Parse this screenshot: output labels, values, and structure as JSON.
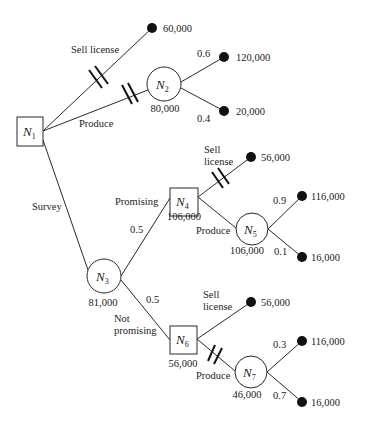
{
  "diagram": {
    "type": "decision-tree",
    "nodes": [
      {
        "id": "N1",
        "kind": "decision",
        "label": "N",
        "sub": "1",
        "value": ""
      },
      {
        "id": "N2",
        "kind": "chance",
        "label": "N",
        "sub": "2",
        "value": "80,000"
      },
      {
        "id": "N3",
        "kind": "chance",
        "label": "N",
        "sub": "3",
        "value": "81,000"
      },
      {
        "id": "N4",
        "kind": "decision",
        "label": "N",
        "sub": "4",
        "value": "106,000"
      },
      {
        "id": "N5",
        "kind": "chance",
        "label": "N",
        "sub": "5",
        "value": "106,000"
      },
      {
        "id": "N6",
        "kind": "decision",
        "label": "N",
        "sub": "6",
        "value": "56,000"
      },
      {
        "id": "N7",
        "kind": "chance",
        "label": "N",
        "sub": "7",
        "value": "46,000"
      }
    ],
    "edges": {
      "n1_sell": {
        "label": "Sell license",
        "pruned": true
      },
      "n1_produce": {
        "label": "Produce",
        "pruned": true
      },
      "n1_survey": {
        "label": "Survey",
        "pruned": false
      },
      "n2_high": {
        "prob": "0.6"
      },
      "n2_low": {
        "prob": "0.4"
      },
      "n3_promising": {
        "label": "Promising",
        "prob": "0.5"
      },
      "n3_not": {
        "label_line1": "Not",
        "label_line2": "promising",
        "prob": "0.5"
      },
      "n4_sell": {
        "label_line1": "Sell",
        "label_line2": "license",
        "pruned": true
      },
      "n4_produce": {
        "label": "Produce",
        "pruned": false
      },
      "n5_high": {
        "prob": "0.9"
      },
      "n5_low": {
        "prob": "0.1"
      },
      "n6_sell": {
        "label_line1": "Sell",
        "label_line2": "license",
        "pruned": false
      },
      "n6_produce": {
        "label": "Produce",
        "pruned": true
      },
      "n7_high": {
        "prob": "0.3"
      },
      "n7_low": {
        "prob": "0.7"
      }
    },
    "payoffs": {
      "n1_sell": "60,000",
      "n2_high": "120,000",
      "n2_low": "20,000",
      "n4_sell": "56,000",
      "n5_high": "116,000",
      "n5_low": "16,000",
      "n6_sell": "56,000",
      "n7_high": "116,000",
      "n7_low": "16,000"
    }
  }
}
